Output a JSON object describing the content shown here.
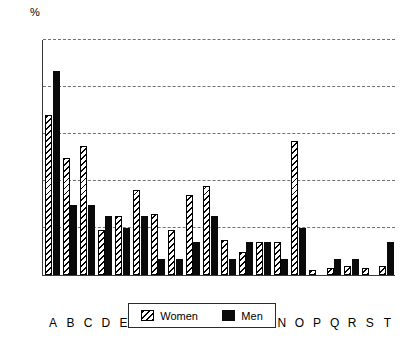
{
  "chart_data": {
    "type": "bar",
    "title": "",
    "subtitle": "",
    "xlabel": "",
    "ylabel": "%",
    "unit_label": "%",
    "ylim": [
      0,
      100
    ],
    "yticks": [
      0,
      20,
      40,
      60,
      80,
      100
    ],
    "grid": true,
    "grid_style": "dashed-horizontal",
    "legend_position": "bottom-center",
    "categories": [
      "A",
      "B",
      "C",
      "D",
      "E",
      "F",
      "G",
      "H",
      "I",
      "J",
      "K",
      "L",
      "M",
      "N",
      "O",
      "P",
      "Q",
      "R",
      "S",
      "T"
    ],
    "series": [
      {
        "name": "Women",
        "fill": "diagonal-hatch",
        "color": "#000000",
        "values": [
          68,
          50,
          55,
          19,
          25,
          36,
          26,
          19,
          34,
          38,
          15,
          10,
          14,
          14,
          57,
          2,
          3,
          4,
          3,
          4
        ]
      },
      {
        "name": "Men",
        "fill": "solid",
        "color": "#0a0a0a",
        "values": [
          87,
          30,
          30,
          25,
          20,
          25,
          7,
          7,
          14,
          25,
          7,
          14,
          14,
          7,
          20,
          0,
          7,
          7,
          0,
          14
        ]
      }
    ]
  },
  "legend": {
    "entries": [
      {
        "label": "Women",
        "swatch": "hatched-swatch"
      },
      {
        "label": "Men",
        "swatch": "solid-black-swatch"
      }
    ]
  }
}
